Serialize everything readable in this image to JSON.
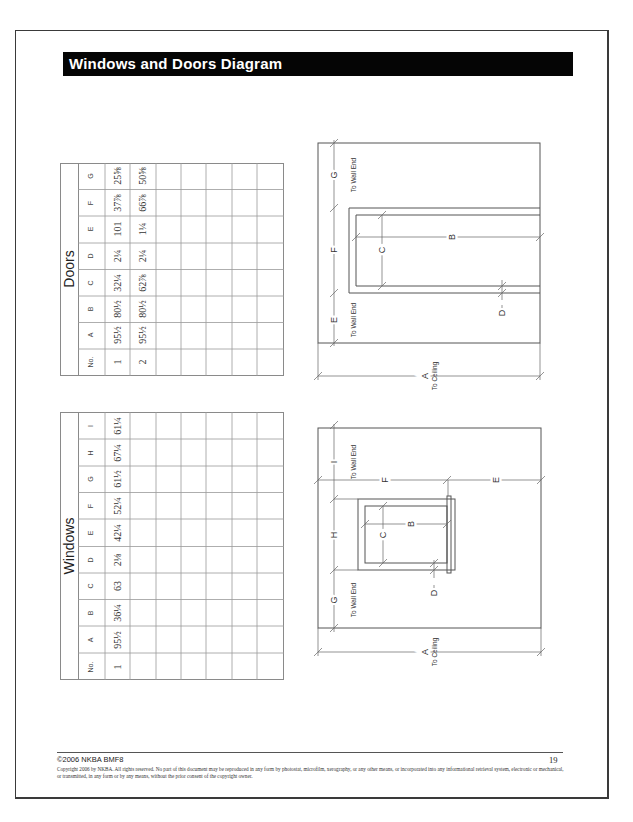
{
  "header": {
    "title": "Windows and Doors Diagram"
  },
  "doors_table": {
    "title": "Doors",
    "columns": [
      "No.",
      "A",
      "B",
      "C",
      "D",
      "E",
      "F",
      "G"
    ],
    "rows": [
      [
        "1",
        "95½",
        "80½",
        "32¼",
        "2¼",
        "101",
        "37⅞",
        "25⅝"
      ],
      [
        "2",
        "95½",
        "80½",
        "62⅞",
        "2¼",
        "1¼",
        "66⅞",
        "50⅝"
      ],
      [
        "",
        "",
        "",
        "",
        "",
        "",
        "",
        ""
      ],
      [
        "",
        "",
        "",
        "",
        "",
        "",
        "",
        ""
      ],
      [
        "",
        "",
        "",
        "",
        "",
        "",
        "",
        ""
      ],
      [
        "",
        "",
        "",
        "",
        "",
        "",
        "",
        ""
      ],
      [
        "",
        "",
        "",
        "",
        "",
        "",
        "",
        ""
      ],
      [
        "",
        "",
        "",
        "",
        "",
        "",
        "",
        ""
      ]
    ]
  },
  "windows_table": {
    "title": "Windows",
    "columns": [
      "No.",
      "A",
      "B",
      "C",
      "D",
      "E",
      "F",
      "G",
      "H",
      "I"
    ],
    "rows": [
      [
        "1",
        "95½",
        "36¼",
        "63",
        "2⅛",
        "42¼",
        "52¼",
        "61½",
        "67¼",
        "61¼"
      ],
      [
        "",
        "",
        "",
        "",
        "",
        "",
        "",
        "",
        "",
        ""
      ],
      [
        "",
        "",
        "",
        "",
        "",
        "",
        "",
        "",
        "",
        ""
      ],
      [
        "",
        "",
        "",
        "",
        "",
        "",
        "",
        "",
        "",
        ""
      ],
      [
        "",
        "",
        "",
        "",
        "",
        "",
        "",
        "",
        "",
        ""
      ],
      [
        "",
        "",
        "",
        "",
        "",
        "",
        "",
        "",
        "",
        ""
      ],
      [
        "",
        "",
        "",
        "",
        "",
        "",
        "",
        "",
        "",
        ""
      ],
      [
        "",
        "",
        "",
        "",
        "",
        "",
        "",
        "",
        "",
        ""
      ]
    ]
  },
  "door_diagram": {
    "labels": {
      "A": "A",
      "A_sub": "To Ceiling",
      "B": "B",
      "C": "C",
      "D": "D",
      "E": "E",
      "E_sub": "To Wall End",
      "F": "F",
      "G": "G",
      "G_sub": "To Wall End"
    }
  },
  "window_diagram": {
    "labels": {
      "A": "A",
      "A_sub": "To Ceiling",
      "B": "B",
      "C": "C",
      "D": "D",
      "E": "E",
      "F": "F",
      "G": "G",
      "G_sub": "To Wall End",
      "H": "H",
      "I": "I",
      "I_sub": "To Wall End"
    }
  },
  "footer": {
    "left": "©2006 NKBA BMF8",
    "page_number": "19",
    "copyright": "Copyright 2006 by NKBA. All rights reserved. No part of this document may be reproduced in any form by photostat, microfilm, xerography, or any other means, or incorporated into any informational retrieval system, electronic or mechanical, or transmitted, in any form or by any means, without the prior consent of the copyright owner."
  }
}
